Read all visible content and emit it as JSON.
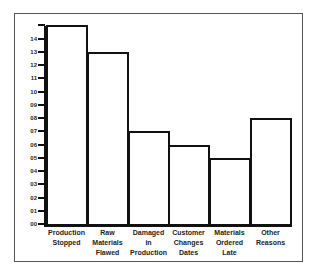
{
  "chart_data": {
    "type": "bar",
    "title": "",
    "xlabel": "",
    "ylabel": "",
    "categories": [
      "Production Stopped",
      "Raw Materials Flawed",
      "Damaged in Production",
      "Customer Changes Dates",
      "Materials Ordered Late",
      "Other Reasons"
    ],
    "category_lines": [
      "Production\nStopped",
      "Raw\nMaterials\nFlawed",
      "Damaged\nin\nProduction",
      "Customer\nChanges\nDates",
      "Materials\nOrdered\nLate",
      "Other\nReasons"
    ],
    "values": [
      15,
      13,
      7,
      6,
      5,
      8
    ],
    "ylim": [
      0,
      15
    ],
    "yticks": [
      "14",
      "13",
      "12",
      "11",
      "10",
      "09",
      "08",
      "07",
      "06",
      "05",
      "04",
      "03",
      "02",
      "01",
      "00"
    ],
    "grid": false,
    "legend": null,
    "colors": {
      "bar_fill": "#ffffff",
      "bar_stroke": "#111111",
      "axis": "#111111",
      "frame": "#555555"
    }
  }
}
